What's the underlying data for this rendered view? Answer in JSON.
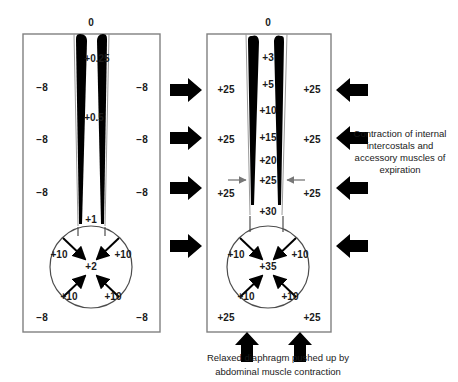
{
  "figure": {
    "title_left": "",
    "title_right": "",
    "left_panel": {
      "top_value": "0",
      "airway_values": [
        "+0.25",
        "+0.5",
        "+1"
      ],
      "alveolar_value": "+2",
      "pleural_values": [
        "−8",
        "−8",
        "−8",
        "−8",
        "−8"
      ],
      "diaphragm_values": [
        "+10",
        "+10",
        "+10",
        "+10"
      ]
    },
    "right_panel": {
      "top_value": "0",
      "airway_values": [
        "+3",
        "+5",
        "+10",
        "+15",
        "+20",
        "+25",
        "+30"
      ],
      "alveolar_value": "+35",
      "pleural_values": [
        "+25",
        "+25",
        "+25",
        "+25",
        "+25",
        "+25",
        "+25",
        "+25"
      ],
      "diaphragm_values": [
        "+10",
        "+10",
        "+10",
        "+10"
      ],
      "annotation": "Contraction of internal intercostals and accessory muscles of expiration",
      "caption_line1": "Relaxed diaphragm pushed up by",
      "caption_line2": "abdominal muscle contraction"
    },
    "colors": {
      "ink": "#1a1a1a",
      "box_stroke": "#808080",
      "circle_stroke": "#4d4d4d",
      "airway_fill": "#000000",
      "arrow_fill": "#000000",
      "small_arrow": "#808080",
      "background": "#ffffff"
    }
  }
}
